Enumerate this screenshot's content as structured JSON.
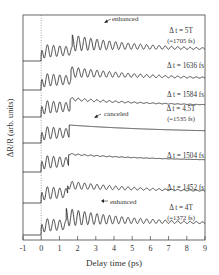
{
  "chart_data": {
    "type": "line",
    "title": "",
    "xlabel": "Delay time (ps)",
    "ylabel": "ΔR/R (arb. units)",
    "xlim": [
      -1,
      9
    ],
    "x_ticks": [
      -1,
      0,
      1,
      2,
      3,
      4,
      5,
      6,
      7,
      8,
      9
    ],
    "grid": false,
    "legend": "none (inline labels at right)",
    "vertical_marker": {
      "x": 0,
      "style": "dotted"
    },
    "oscillation_period_fs": 341,
    "series": [
      {
        "name": "Δt = 5T (=1705 fs)",
        "label_line1": "Δ t = 5T",
        "label_line2": "(=1705 fs)",
        "second_pulse_ps": 1.705,
        "effect": "enhanced",
        "baseline_px": 61
      },
      {
        "name": "Δt = 1636 fs",
        "label_line1": "Δ t = 1636 fs",
        "label_line2": "",
        "second_pulse_ps": 1.636,
        "effect": "",
        "baseline_px": 90
      },
      {
        "name": "Δt = 1584 fs",
        "label_line1": "Δ t = 1584 fs",
        "label_line2": "",
        "second_pulse_ps": 1.584,
        "effect": "",
        "baseline_px": 117
      },
      {
        "name": "Δt = 4.5T (=1535 fs)",
        "label_line1": "Δ t = 4.5T",
        "label_line2": "(=1535 fs)",
        "second_pulse_ps": 1.535,
        "effect": "canceled",
        "baseline_px": 143
      },
      {
        "name": "Δt = 1504 fs",
        "label_line1": "Δ t = 1504 fs",
        "label_line2": "",
        "second_pulse_ps": 1.504,
        "effect": "",
        "baseline_px": 172
      },
      {
        "name": "Δt = 1452 fs",
        "label_line1": "Δ t = 1452 fs",
        "label_line2": "",
        "second_pulse_ps": 1.452,
        "effect": "",
        "baseline_px": 203
      },
      {
        "name": "Δt = 4T (=1372 fs)",
        "label_line1": "Δ t = 4T",
        "label_line2": "(=1372 fs)",
        "second_pulse_ps": 1.372,
        "effect": "enhanced",
        "baseline_px": 235
      }
    ],
    "annotations": [
      {
        "text": "enhanced",
        "series": "Δt = 5T (=1705 fs)",
        "x_ps": 2.2
      },
      {
        "text": "canceled",
        "series": "Δt = 4.5T (=1535 fs)",
        "x_ps": 2.2
      },
      {
        "text": "enhanced",
        "series": "Δt = 4T (=1372 fs)",
        "x_ps": 2.2
      }
    ]
  },
  "labels": {
    "xlabel": "Delay time (ps)",
    "ylabel": "ΔR/R (arb. units)",
    "enhanced_top": "enhanced",
    "canceled": "canceled",
    "enhanced_bottom": "enhanced",
    "s0_l1": "Δ t = 5T",
    "s0_l2": "(=1705 fs)",
    "s1_l1": "Δ t = 1636 fs",
    "s2_l1": "Δ t = 1584 fs",
    "s3_l1": "Δ t = 4.5T",
    "s3_l2": "(=1535 fs)",
    "s4_l1": "Δ t = 1504 fs",
    "s5_l1": "Δ t = 1452 fs",
    "s6_l1": "Δ t = 4T",
    "s6_l2": "(=1372 fs)",
    "ticks": [
      "-1",
      "0",
      "1",
      "2",
      "3",
      "4",
      "5",
      "6",
      "7",
      "8",
      "9"
    ]
  }
}
